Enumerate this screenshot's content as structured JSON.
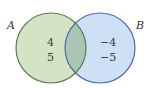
{
  "diagram": {
    "type": "venn",
    "sets": [
      {
        "name": "A",
        "label": "A",
        "fill": "#d3e3c3",
        "stroke": "#5e7d55",
        "elements_only": [
          "4",
          "5"
        ]
      },
      {
        "name": "B",
        "label": "B",
        "fill": "#cde0f6",
        "stroke": "#4c6cab",
        "elements_only": [
          "−4",
          "−5"
        ]
      }
    ],
    "intersection": {
      "fill": "#a8c6b6",
      "elements": []
    }
  },
  "labels": {
    "set_a": "A",
    "set_b": "B",
    "a_item_1": "4",
    "a_item_2": "5",
    "b_item_1": "−4",
    "b_item_2": "−5"
  }
}
